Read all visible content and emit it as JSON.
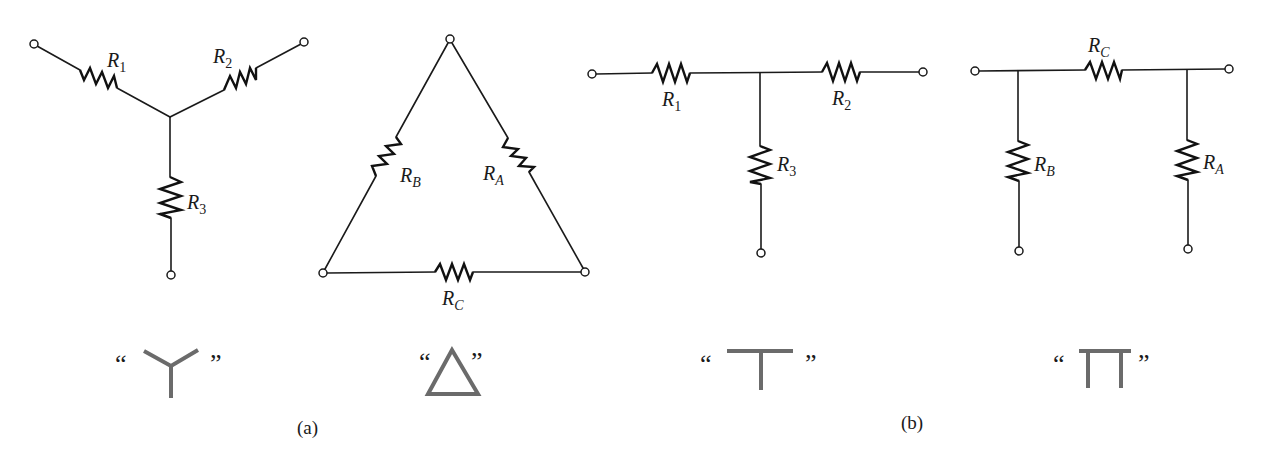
{
  "figure": {
    "caption_a": "(a)",
    "caption_b": "(b)",
    "quote_open": "“",
    "quote_close": "”"
  },
  "networks": {
    "wye": {
      "name": "Y network",
      "symbol_name": "Y",
      "resistors": [
        {
          "base": "R",
          "sub": "1"
        },
        {
          "base": "R",
          "sub": "2"
        },
        {
          "base": "R",
          "sub": "3"
        }
      ]
    },
    "delta": {
      "name": "Delta network",
      "symbol_name": "Δ",
      "resistors": [
        {
          "base": "R",
          "sub": "A"
        },
        {
          "base": "R",
          "sub": "B"
        },
        {
          "base": "R",
          "sub": "C"
        }
      ]
    },
    "tee": {
      "name": "T network",
      "symbol_name": "T",
      "resistors": [
        {
          "base": "R",
          "sub": "1"
        },
        {
          "base": "R",
          "sub": "2"
        },
        {
          "base": "R",
          "sub": "3"
        }
      ]
    },
    "pi": {
      "name": "Pi network",
      "symbol_name": "Π",
      "resistors": [
        {
          "base": "R",
          "sub": "C"
        },
        {
          "base": "R",
          "sub": "B"
        },
        {
          "base": "R",
          "sub": "A"
        }
      ]
    }
  },
  "colors": {
    "wire": "#1a1a1a",
    "symbol": "#6b6b6b",
    "background": "#ffffff"
  }
}
